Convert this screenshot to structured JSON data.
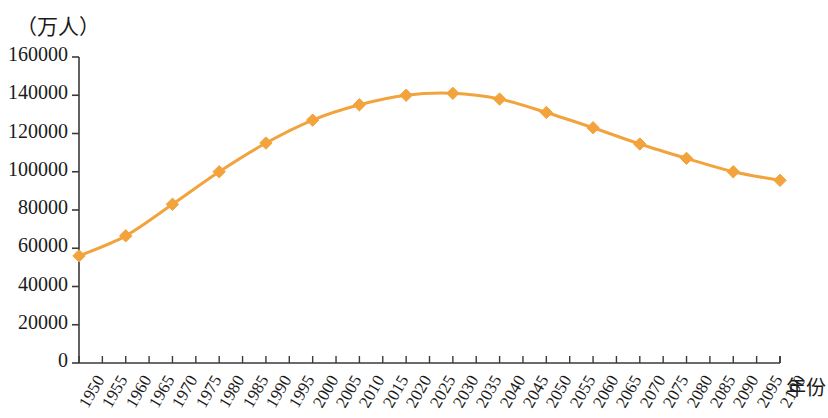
{
  "chart_data": {
    "type": "line",
    "title": "",
    "unit_label": "（万人）",
    "xlabel": "年份",
    "ylabel": "",
    "ylim": [
      0,
      160000
    ],
    "y_ticks": [
      0,
      20000,
      40000,
      60000,
      80000,
      100000,
      120000,
      140000,
      160000
    ],
    "y_tick_labels": [
      "0",
      "20000",
      "40000",
      "60000",
      "80000",
      "100000",
      "120000",
      "140000",
      "160000"
    ],
    "xlim": [
      1950,
      2100
    ],
    "x_ticks": [
      1950,
      1955,
      1960,
      1965,
      1970,
      1975,
      1980,
      1985,
      1990,
      1995,
      2000,
      2005,
      2010,
      2015,
      2020,
      2025,
      2030,
      2035,
      2040,
      2045,
      2050,
      2055,
      2060,
      2065,
      2070,
      2075,
      2080,
      2085,
      2090,
      2095,
      2100
    ],
    "x_tick_labels": [
      "1950",
      "1955",
      "1960",
      "1965",
      "1970",
      "1975",
      "1980",
      "1985",
      "1990",
      "1995",
      "2000",
      "2005",
      "2010",
      "2015",
      "2020",
      "2025",
      "2030",
      "2035",
      "2040",
      "2045",
      "2050",
      "2055",
      "2060",
      "2065",
      "2070",
      "2075",
      "2080",
      "2085",
      "2090",
      "2095",
      "2100"
    ],
    "grid": false,
    "legend": null,
    "series": [
      {
        "name": "人口",
        "color": "#F2A33C",
        "marker": "diamond",
        "x": [
          1950,
          1960,
          1970,
          1980,
          1990,
          2000,
          2010,
          2020,
          2030,
          2040,
          2050,
          2060,
          2070,
          2080,
          2090,
          2100
        ],
        "values": [
          56000,
          66500,
          83000,
          100000,
          115000,
          127000,
          135000,
          140000,
          141000,
          138000,
          131000,
          123000,
          114500,
          107000,
          100000,
          95500
        ]
      }
    ]
  },
  "colors": {
    "series": "#F2A33C",
    "axis": "#3a3a3a",
    "text": "#1a1a1a"
  }
}
